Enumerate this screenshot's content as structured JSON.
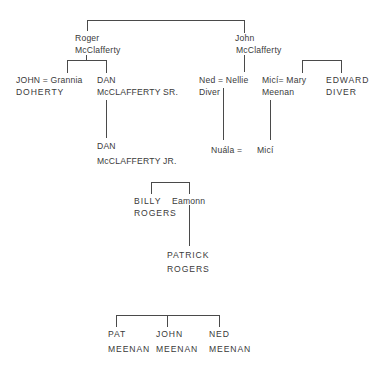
{
  "diagram": {
    "type": "family-tree",
    "line_color": "#4a4a4a",
    "text_color": "#3a3a3a",
    "people": {
      "roger": {
        "line1": "Roger",
        "line2": "McClafferty"
      },
      "john_sr": {
        "line1": "John",
        "line2": "McClafferty"
      },
      "john_grannia": {
        "line1": "JOHN = Grannia",
        "line2": "DOHERTY"
      },
      "dan_sr": {
        "line1": "DAN",
        "line2": "McCLAFFERTY SR."
      },
      "dan_jr": {
        "line1": "DAN",
        "line2": "McCLAFFERTY JR."
      },
      "ned_nellie": {
        "line1": "Ned = Nellie",
        "line2": "Diver"
      },
      "mici_mary": {
        "line1": "Micí= Mary",
        "line2": "Meenan"
      },
      "edward": {
        "line1": "EDWARD",
        "line2": "DIVER"
      },
      "nuala": {
        "line1": "Nuála ="
      },
      "mici_child": {
        "line1": "Micí"
      },
      "billy": {
        "line1": "BILLY",
        "line2": "ROGERS"
      },
      "eamonn": {
        "line1": "Eamonn"
      },
      "patrick": {
        "line1": "PATRICK",
        "line2": "ROGERS"
      },
      "pat_meenan": {
        "line1": "PAT",
        "line2": "MEENAN"
      },
      "john_meenan": {
        "line1": "JOHN",
        "line2": "MEENAN"
      },
      "ned_meenan": {
        "line1": "NED",
        "line2": "MEENAN"
      }
    }
  }
}
